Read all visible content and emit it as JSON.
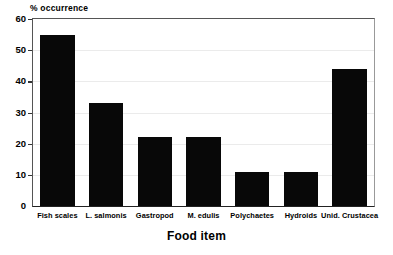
{
  "chart_data": {
    "type": "bar",
    "title": "",
    "xlabel": "Food item",
    "ylabel": "% occurrence",
    "categories": [
      "Fish scales",
      "L. salmonis",
      "Gastropod",
      "M. edulis",
      "Polychaetes",
      "Hydroids",
      "Unid. Crustacea"
    ],
    "values": [
      55,
      33,
      22,
      22,
      11,
      11,
      44
    ],
    "ylim": [
      0,
      60
    ],
    "yticks": [
      0,
      10,
      20,
      30,
      40,
      50,
      60
    ],
    "ytick_labels": [
      "0",
      "10",
      "20",
      "30",
      "40",
      "50",
      "60"
    ],
    "grid": true,
    "grid_axis": "y",
    "legend": false,
    "legend_position": "none",
    "bar_color": "#080808",
    "background_color": "#ffffff",
    "gridline_color": "#ebebeb"
  },
  "axes": {
    "y_axis_title": "% occurrence",
    "x_axis_title": "Food item"
  }
}
